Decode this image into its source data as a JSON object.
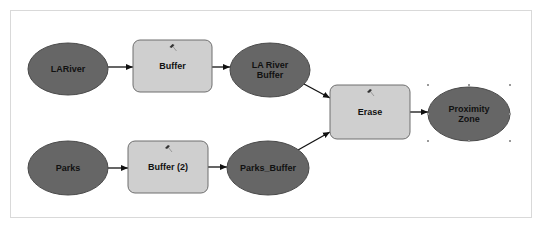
{
  "colors": {
    "data_fill": "#666666",
    "data_stroke": "#4a4a4a",
    "tool_fill": "#cfcfcf",
    "tool_stroke": "#6f6f6f",
    "connector": "#111111",
    "frame_border": "#d9d9d9",
    "handle": "#9a9a9a"
  },
  "nodes": [
    {
      "id": "lariver",
      "type": "data",
      "shape": "ellipse",
      "lines": [
        "LARiver"
      ],
      "cx": 68,
      "cy": 69,
      "rx": 40,
      "ry": 26
    },
    {
      "id": "buffer",
      "type": "tool",
      "shape": "rect",
      "lines": [
        "Buffer"
      ],
      "icon": "hammer-icon",
      "x": 133,
      "y": 40,
      "w": 79,
      "h": 52
    },
    {
      "id": "lariver_buffer",
      "type": "data",
      "shape": "ellipse",
      "lines": [
        "LA River",
        "Buffer"
      ],
      "cx": 270,
      "cy": 70,
      "rx": 40,
      "ry": 27
    },
    {
      "id": "erase",
      "type": "tool",
      "shape": "rect",
      "lines": [
        "Erase"
      ],
      "icon": "hammer-icon",
      "x": 330,
      "y": 85,
      "w": 80,
      "h": 54
    },
    {
      "id": "proximity_zone",
      "type": "data",
      "shape": "ellipse",
      "lines": [
        "Proximity",
        "Zone"
      ],
      "cx": 469,
      "cy": 114,
      "rx": 41,
      "ry": 27,
      "selected": true
    },
    {
      "id": "parks",
      "type": "data",
      "shape": "ellipse",
      "lines": [
        "Parks"
      ],
      "cx": 68,
      "cy": 168,
      "rx": 40,
      "ry": 27
    },
    {
      "id": "buffer2",
      "type": "tool",
      "shape": "rect",
      "lines": [
        "Buffer (2)"
      ],
      "icon": "hammer-icon",
      "x": 128,
      "y": 141,
      "w": 80,
      "h": 52
    },
    {
      "id": "parks_buffer",
      "type": "data",
      "shape": "ellipse",
      "lines": [
        "Parks_Buffer"
      ],
      "cx": 268,
      "cy": 168,
      "rx": 41,
      "ry": 27
    }
  ],
  "edges": [
    {
      "from": "lariver",
      "to": "buffer",
      "x1": 108,
      "y1": 67,
      "x2": 133,
      "y2": 67
    },
    {
      "from": "buffer",
      "to": "lariver_buffer",
      "x1": 212,
      "y1": 67,
      "x2": 230,
      "y2": 67
    },
    {
      "from": "lariver_buffer",
      "to": "erase",
      "x1": 304,
      "y1": 84,
      "x2": 330,
      "y2": 98
    },
    {
      "from": "parks_buffer",
      "to": "erase",
      "x1": 298,
      "y1": 150,
      "x2": 330,
      "y2": 132
    },
    {
      "from": "erase",
      "to": "proximity_zone",
      "x1": 410,
      "y1": 112,
      "x2": 428,
      "y2": 112
    },
    {
      "from": "parks",
      "to": "buffer2",
      "x1": 108,
      "y1": 168,
      "x2": 128,
      "y2": 168
    },
    {
      "from": "buffer2",
      "to": "parks_buffer",
      "x1": 208,
      "y1": 167,
      "x2": 227,
      "y2": 167
    }
  ],
  "selection_handles": [
    [
      428,
      85
    ],
    [
      469,
      85
    ],
    [
      510,
      85
    ],
    [
      428,
      114
    ],
    [
      510,
      114
    ],
    [
      428,
      141
    ],
    [
      469,
      141
    ],
    [
      510,
      141
    ]
  ]
}
